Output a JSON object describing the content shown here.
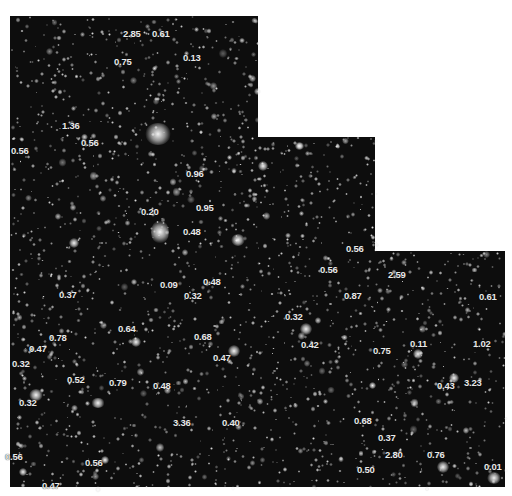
{
  "image": {
    "description": "Deep field galaxy image with redshift labels",
    "background_color": "#0d0d0d",
    "label_color": "#e8e8e8"
  },
  "redshift_labels": [
    {
      "text": "2.85",
      "x": 133,
      "y": 34
    },
    {
      "text": "0.61",
      "x": 162,
      "y": 34
    },
    {
      "text": "0.13",
      "x": 193,
      "y": 58
    },
    {
      "text": "0.75",
      "x": 124,
      "y": 62
    },
    {
      "text": "1.36",
      "x": 72,
      "y": 126
    },
    {
      "text": "0.56",
      "x": 91,
      "y": 143
    },
    {
      "text": "0.56",
      "x": 21,
      "y": 151
    },
    {
      "text": "0.96",
      "x": 196,
      "y": 174
    },
    {
      "text": "0.95",
      "x": 206,
      "y": 208
    },
    {
      "text": "0.20",
      "x": 151,
      "y": 212
    },
    {
      "text": "0.48",
      "x": 193,
      "y": 232
    },
    {
      "text": "0.56",
      "x": 356,
      "y": 249
    },
    {
      "text": "0.56",
      "x": 330,
      "y": 270
    },
    {
      "text": "2.59",
      "x": 398,
      "y": 275
    },
    {
      "text": "0.09",
      "x": 170,
      "y": 285
    },
    {
      "text": "0.48",
      "x": 213,
      "y": 282
    },
    {
      "text": "0.87",
      "x": 354,
      "y": 296
    },
    {
      "text": "0.37",
      "x": 69,
      "y": 295
    },
    {
      "text": "0.32",
      "x": 194,
      "y": 296
    },
    {
      "text": "0.61",
      "x": 489,
      "y": 297
    },
    {
      "text": "0.32",
      "x": 295,
      "y": 317
    },
    {
      "text": "0.64",
      "x": 128,
      "y": 329
    },
    {
      "text": "0.68",
      "x": 204,
      "y": 337
    },
    {
      "text": "0.78",
      "x": 59,
      "y": 338
    },
    {
      "text": "0.42",
      "x": 311,
      "y": 345
    },
    {
      "text": "0.75",
      "x": 383,
      "y": 351
    },
    {
      "text": "0.11",
      "x": 420,
      "y": 344
    },
    {
      "text": "1.02",
      "x": 483,
      "y": 344
    },
    {
      "text": "0.47",
      "x": 39,
      "y": 349
    },
    {
      "text": "0.47",
      "x": 223,
      "y": 358
    },
    {
      "text": "0.32",
      "x": 22,
      "y": 364
    },
    {
      "text": "0.52",
      "x": 77,
      "y": 380
    },
    {
      "text": "0.79",
      "x": 119,
      "y": 383
    },
    {
      "text": "0.48",
      "x": 163,
      "y": 386
    },
    {
      "text": "0.43",
      "x": 447,
      "y": 386
    },
    {
      "text": "3.23",
      "x": 474,
      "y": 383
    },
    {
      "text": "0.32",
      "x": 29,
      "y": 403
    },
    {
      "text": "3.36",
      "x": 183,
      "y": 423
    },
    {
      "text": "0.40",
      "x": 232,
      "y": 423
    },
    {
      "text": "0.68",
      "x": 364,
      "y": 421
    },
    {
      "text": "0.37",
      "x": 388,
      "y": 438
    },
    {
      "text": "2.80",
      "x": 395,
      "y": 455
    },
    {
      "text": "0.76",
      "x": 437,
      "y": 455
    },
    {
      "text": "0.56",
      "x": 15,
      "y": 457
    },
    {
      "text": "0.56",
      "x": 95,
      "y": 463
    },
    {
      "text": "0.50",
      "x": 367,
      "y": 470
    },
    {
      "text": "0.01",
      "x": 494,
      "y": 467
    },
    {
      "text": "0.47",
      "x": 52,
      "y": 486
    }
  ],
  "bright_objects": [
    {
      "x": 158,
      "y": 134,
      "w": 26,
      "h": 22
    },
    {
      "x": 160,
      "y": 232,
      "w": 18,
      "h": 24
    },
    {
      "x": 74,
      "y": 243,
      "w": 10,
      "h": 10
    },
    {
      "x": 238,
      "y": 240,
      "w": 14,
      "h": 12
    },
    {
      "x": 263,
      "y": 166,
      "w": 10,
      "h": 10
    },
    {
      "x": 136,
      "y": 342,
      "w": 10,
      "h": 10
    },
    {
      "x": 234,
      "y": 351,
      "w": 12,
      "h": 12
    },
    {
      "x": 306,
      "y": 329,
      "w": 12,
      "h": 12
    },
    {
      "x": 418,
      "y": 354,
      "w": 10,
      "h": 10
    },
    {
      "x": 98,
      "y": 403,
      "w": 14,
      "h": 10
    },
    {
      "x": 36,
      "y": 395,
      "w": 14,
      "h": 12
    },
    {
      "x": 454,
      "y": 378,
      "w": 10,
      "h": 10
    },
    {
      "x": 443,
      "y": 467,
      "w": 12,
      "h": 12
    },
    {
      "x": 494,
      "y": 478,
      "w": 14,
      "h": 12
    },
    {
      "x": 23,
      "y": 472,
      "w": 8,
      "h": 8
    },
    {
      "x": 105,
      "y": 460,
      "w": 8,
      "h": 8
    },
    {
      "x": 372,
      "y": 385,
      "w": 7,
      "h": 7
    },
    {
      "x": 299,
      "y": 146,
      "w": 8,
      "h": 8
    }
  ]
}
